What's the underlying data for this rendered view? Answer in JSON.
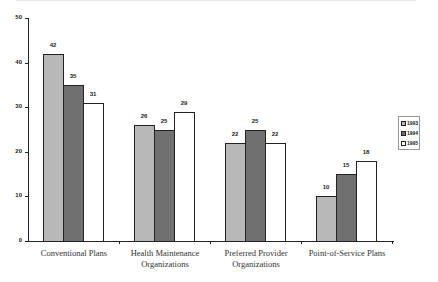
{
  "chart_data": {
    "type": "bar",
    "title": "",
    "xlabel": "",
    "ylabel": "",
    "ylim": [
      0,
      50
    ],
    "yticks": [
      0,
      10,
      20,
      30,
      40,
      50
    ],
    "categories": [
      "Conventional Plans",
      "Health Maintenance Organizations",
      "Preferred Provider Organizations",
      "Point-of-Service Plans"
    ],
    "series": [
      {
        "name": "1993",
        "values": [
          42,
          26,
          22,
          10
        ],
        "color": "#b8b8b8"
      },
      {
        "name": "1994",
        "values": [
          35,
          25,
          25,
          15
        ],
        "color": "#707070"
      },
      {
        "name": "1995",
        "values": [
          31,
          29,
          22,
          18
        ],
        "color": "#ffffff"
      }
    ],
    "legend_position": "right",
    "grid": false
  },
  "labels": {
    "categories": [
      "Conventional Plans",
      "Health Maintenance\nOrganizations",
      "Preferred Provider\nOrganizations",
      "Point-of-Service Plans"
    ],
    "y_ticks": [
      "0",
      "10",
      "20",
      "30",
      "40",
      "50"
    ],
    "legend": [
      "1993",
      "1994",
      "1995"
    ]
  }
}
